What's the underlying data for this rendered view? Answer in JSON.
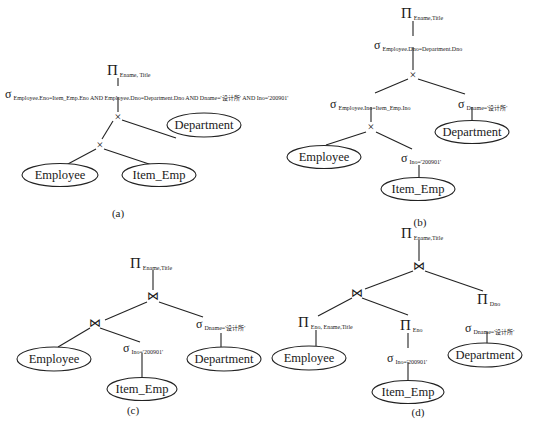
{
  "symbols": {
    "projection": "Π",
    "selection": "σ",
    "cross": "×",
    "join": "⋈"
  },
  "relations": {
    "employee": "Employee",
    "item_emp": "Item_Emp",
    "department": "Department"
  },
  "panel_a": {
    "caption": "(a)",
    "projection_sub": "Ename, Title",
    "selection_sub": "Employee.Eno=Item_Emp.Eno AND Employee.Dno=Department.Dno AND Dname='设计所' AND Ino='200901'"
  },
  "panel_b": {
    "caption": "(b)",
    "projection_sub": "Ename,Title",
    "selection_top_sub": "Employee.Dno=Department.Dno",
    "selection_left_sub": "Employee.Ino=Item_Emp.Ino",
    "selection_right_sub": "Dname='设计所'",
    "selection_item_sub": "Ino='200901'"
  },
  "panel_c": {
    "caption": "(c)",
    "projection_sub": "Ename,Title",
    "selection_item_sub": "Ino='200901'",
    "selection_dept_sub": "Dname='设计所'"
  },
  "panel_d": {
    "caption": "(d)",
    "projection_top_sub": "Ename,Title",
    "projection_emp_sub": "Eno, Ename,Title",
    "projection_item_sub": "Eno",
    "projection_dept_sub": "Dno",
    "selection_item_sub": "Ino='200901'",
    "selection_dept_sub": "Dname='设计所'"
  }
}
